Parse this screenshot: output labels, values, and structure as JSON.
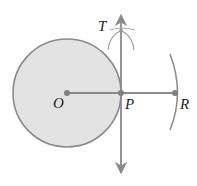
{
  "diagram": {
    "labels": {
      "center": "O",
      "tangent_point": "P",
      "radius_extension_point": "R",
      "tangent_line_point": "T"
    },
    "colors": {
      "circle_fill": "#e3e3e3",
      "line": "#8a8a8a",
      "point": "#808080",
      "text": "#222222",
      "background": "#ffffff"
    }
  }
}
